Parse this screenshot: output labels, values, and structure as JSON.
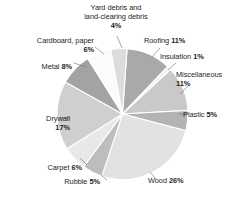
{
  "chart_data": {
    "type": "pie",
    "title": "",
    "legend_position": "none",
    "labels_outside": true,
    "total": 100,
    "unit": "%",
    "categories": [
      "Roofing",
      "Insulation",
      "Miscellaneous",
      "Plastic",
      "Wood",
      "Rubble",
      "Carpet",
      "Drywall",
      "Metal",
      "Cardboard, paper",
      "Yard debris and land-clearing debris"
    ],
    "values": [
      11,
      1,
      11,
      5,
      26,
      5,
      6,
      17,
      8,
      6,
      4
    ],
    "colors": [
      "#a9a9a9",
      "#efefef",
      "#c9c9c9",
      "#b4b4b4",
      "#e2e2e2",
      "#bdbdbd",
      "#e8e8e8",
      "#cfcfcf",
      "#a3a3a3",
      "#fbfbfb",
      "#dcdcdc"
    ],
    "slices": [
      {
        "label": "Roofing",
        "value": 11,
        "display": "Roofing 11%",
        "name_text": "Roofing ",
        "pct_text": "11%"
      },
      {
        "label": "Insulation",
        "value": 1,
        "display": "Insulation 1%",
        "name_text": "Insulation ",
        "pct_text": "1%"
      },
      {
        "label": "Miscellaneous",
        "value": 11,
        "display": "Miscellaneous 11%",
        "name_text": "Miscellaneous",
        "pct_text": "11%"
      },
      {
        "label": "Plastic",
        "value": 5,
        "display": "Plastic 5%",
        "name_text": "Plastic ",
        "pct_text": "5%"
      },
      {
        "label": "Wood",
        "value": 26,
        "display": "Wood 26%",
        "name_text": "Wood ",
        "pct_text": "26%"
      },
      {
        "label": "Rubble",
        "value": 5,
        "display": "Rubble 5%",
        "name_text": "Rubble ",
        "pct_text": "5%"
      },
      {
        "label": "Carpet",
        "value": 6,
        "display": "Carpet 6%",
        "name_text": "Carpet ",
        "pct_text": "6%"
      },
      {
        "label": "Drywall",
        "value": 17,
        "display": "Drywall 17%",
        "name_text": "Drywall",
        "pct_text": "17%"
      },
      {
        "label": "Metal",
        "value": 8,
        "display": "Metal 8%",
        "name_text": "Metal ",
        "pct_text": "8%"
      },
      {
        "label": "Cardboard, paper",
        "value": 6,
        "display": "Cardboard, paper 6%",
        "name_text": "Cardboard, paper",
        "pct_text": "6%"
      },
      {
        "label": "Yard debris and land-clearing debris",
        "value": 4,
        "display": "Yard debris and land-clearing debris 4%",
        "name_text": "Yard debris and land-clearing debris",
        "pct_text": "4%"
      }
    ]
  },
  "labels": {
    "yard": {
      "line1": "Yard debris and",
      "line2": "land-clearing debris",
      "pct": "4%"
    },
    "cardboard": {
      "name": "Cardboard, paper",
      "pct": "6%"
    },
    "metal": {
      "name": "Metal ",
      "pct": "8%"
    },
    "drywall": {
      "name": "Drywall",
      "pct": "17%"
    },
    "carpet": {
      "name": "Carpet ",
      "pct": "6%"
    },
    "rubble": {
      "name": "Rubble ",
      "pct": "5%"
    },
    "wood": {
      "name": "Wood ",
      "pct": "26%"
    },
    "plastic": {
      "name": "Plastic ",
      "pct": "5%"
    },
    "misc": {
      "name": "Miscellaneous",
      "pct": "11%"
    },
    "insulation": {
      "name": "Insulation ",
      "pct": "1%"
    },
    "roofing": {
      "name": "Roofing ",
      "pct": "11%"
    }
  }
}
